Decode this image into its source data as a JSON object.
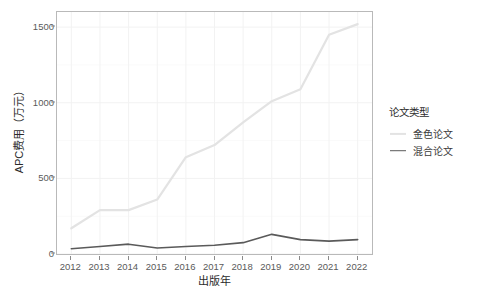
{
  "chart_data": {
    "type": "line",
    "title": "",
    "xlabel": "出版年",
    "ylabel": "APC费用（万元）",
    "categories": [
      "2012",
      "2013",
      "2014",
      "2015",
      "2016",
      "2017",
      "2018",
      "2019",
      "2020",
      "2021",
      "2022"
    ],
    "x": [
      2012,
      2013,
      2014,
      2015,
      2016,
      2017,
      2018,
      2019,
      2020,
      2021,
      2022
    ],
    "xlim": [
      2011.5,
      2022.5
    ],
    "ylim": [
      0,
      1600
    ],
    "y_ticks": [
      0,
      500,
      1000,
      1500
    ],
    "y_tick_labels": [
      "0",
      "500",
      "1000",
      "1500"
    ],
    "grid": true,
    "legend_position": "right",
    "series": [
      {
        "name": "金色论文",
        "color": "#e3e3e3",
        "values": [
          170,
          290,
          290,
          360,
          640,
          720,
          870,
          1010,
          1090,
          1450,
          1520
        ]
      },
      {
        "name": "混合论文",
        "color": "#5a5a5a",
        "values": [
          35,
          50,
          65,
          40,
          50,
          58,
          75,
          130,
          95,
          85,
          95
        ]
      }
    ]
  },
  "legend": {
    "title": "论文类型",
    "items": [
      {
        "label": "金色论文"
      },
      {
        "label": "混合论文"
      }
    ]
  },
  "axes": {
    "y_title": "APC费用（万元）",
    "x_title": "出版年"
  },
  "colors": {
    "gold_series": "#e3e3e3",
    "hybrid_series": "#5a5a5a",
    "panel_border": "#b9b9b9",
    "grid": "#f2f2f2",
    "axis_text": "#5a5a5a",
    "background": "#ffffff"
  }
}
